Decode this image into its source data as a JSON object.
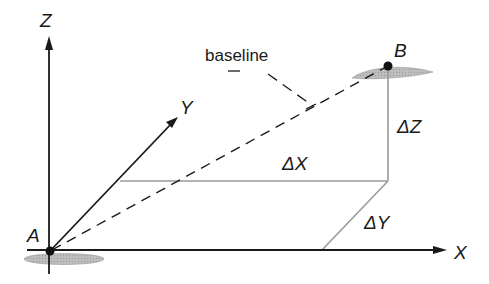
{
  "diagram": {
    "axes": {
      "x_label": "X",
      "y_label": "Y",
      "z_label": "Z"
    },
    "points": {
      "a_label": "A",
      "b_label": "B"
    },
    "baseline_label": "baseline",
    "components": {
      "dx_label": "ΔX",
      "dy_label": "ΔY",
      "dz_label": "ΔZ"
    },
    "colors": {
      "axis": "#1a1a1a",
      "component_line": "#9a9a9a",
      "ellipse_fill": "#b5b5b5",
      "point": "#111111"
    }
  }
}
